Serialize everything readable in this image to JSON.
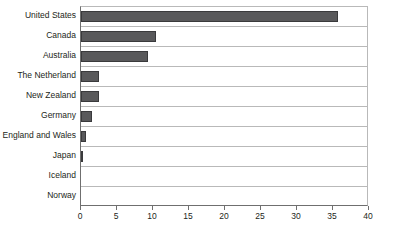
{
  "chart_data": {
    "type": "bar",
    "orientation": "horizontal",
    "title": "",
    "subtitle": "",
    "xlabel": "",
    "ylabel": "",
    "xlim": [
      0,
      40
    ],
    "xticks": [
      0,
      5,
      10,
      15,
      20,
      25,
      30,
      35,
      40
    ],
    "xtick_labels": [
      "0",
      "5",
      "10",
      "15",
      "20",
      "25",
      "30",
      "35",
      "40"
    ],
    "grid": "horizontal-row-separators",
    "legend": "none",
    "bar_color": "#59595b",
    "bar_border_color": "#3a3a3c",
    "axis_color": "#6f6f6f",
    "gridline_color": "#b9b9b9",
    "text_color": "#231f20",
    "categories": [
      "United States",
      "Canada",
      "Australia",
      "The Netherland",
      "New Zealand",
      "Germany",
      "England and Wales",
      "Japan",
      "Iceland",
      "Norway"
    ],
    "values": [
      35.7,
      10.4,
      9.3,
      2.5,
      2.5,
      1.5,
      0.7,
      0.3,
      0,
      0
    ]
  }
}
